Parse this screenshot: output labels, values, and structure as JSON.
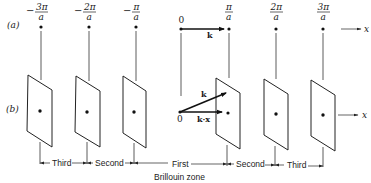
{
  "panel_labels": {
    "a": "(a)",
    "b": "(b)"
  },
  "top_row": {
    "points": [
      {
        "sign": "−",
        "numerator": "3π",
        "denominator": "a",
        "x": 41
      },
      {
        "sign": "−",
        "numerator": "2π",
        "denominator": "a",
        "x": 89
      },
      {
        "sign": "−",
        "numerator": "π",
        "denominator": "a",
        "x": 136
      },
      {
        "sign": "",
        "numerator": "0",
        "denominator": "",
        "x": 181
      },
      {
        "sign": "",
        "numerator": "π",
        "denominator": "a",
        "x": 229
      },
      {
        "sign": "",
        "numerator": "2π",
        "denominator": "a",
        "x": 276
      },
      {
        "sign": "",
        "numerator": "3π",
        "denominator": "a",
        "x": 323
      }
    ],
    "origin_label": "0",
    "vector_label": "k",
    "axis_label": "x"
  },
  "bottom_row": {
    "origin_label": "0",
    "vector_k_label": "k",
    "vector_kx_label": "k·x",
    "axis_label": "x"
  },
  "zones": {
    "left_third": "Third",
    "left_second": "Second",
    "first": "First",
    "right_second": "Second",
    "right_third": "Third",
    "caption": "Brillouin zone"
  },
  "colors": {
    "ink": "#1a1a1a",
    "background": "#ffffff"
  }
}
